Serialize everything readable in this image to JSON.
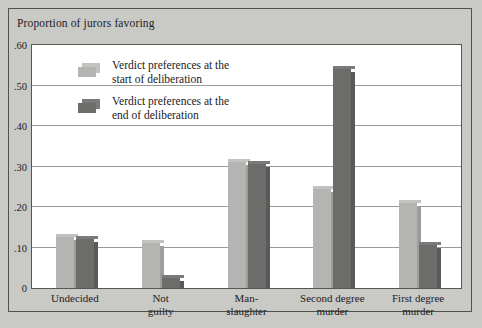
{
  "figure": {
    "title": "Proportion of jurors favoring",
    "background_color": "#c9c9c5",
    "plot_background_color": "#ffffff",
    "frame_color": "#50504c"
  },
  "legend": {
    "position": "top-left-inside-plot",
    "entries": [
      {
        "label": "Verdict preferences at the\nstart of deliberation",
        "color": "#b4b4b2"
      },
      {
        "label": "Verdict preferences at the\nend of deliberation",
        "color": "#6c6c6a"
      }
    ]
  },
  "chart_data": {
    "type": "bar",
    "title": "Proportion of jurors favoring",
    "xlabel": "",
    "ylabel": "Proportion of jurors favoring",
    "ylim": [
      0,
      0.6
    ],
    "grid": true,
    "yticks": [
      0,
      0.1,
      0.2,
      0.3,
      0.4,
      0.5,
      0.6
    ],
    "ytick_labels": [
      "0",
      ".10",
      ".20",
      ".30",
      ".40",
      ".50",
      ".60"
    ],
    "categories": [
      "Undecided",
      "Not\nguilty",
      "Man-\nslaughter",
      "Second degree\nmurder",
      "First degree\nmurder"
    ],
    "series": [
      {
        "name": "Verdict preferences at the start of deliberation",
        "color": "#b4b4b2",
        "values": [
          0.125,
          0.11,
          0.31,
          0.245,
          0.21
        ]
      },
      {
        "name": "Verdict preferences at the end of deliberation",
        "color": "#6c6c6a",
        "values": [
          0.12,
          0.025,
          0.305,
          0.54,
          0.105
        ]
      }
    ]
  }
}
